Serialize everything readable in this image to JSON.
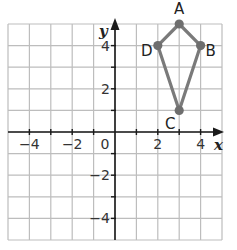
{
  "diagram": {
    "type": "coordinate-plane",
    "x_range": [
      -5,
      5
    ],
    "y_range": [
      -5,
      5
    ],
    "grid_step": 1,
    "x_axis_label": "x",
    "y_axis_label": "y",
    "x_tick_labels": [
      {
        "value": -4,
        "text": "−4"
      },
      {
        "value": -2,
        "text": "−2"
      },
      {
        "value": 2,
        "text": "2"
      },
      {
        "value": 4,
        "text": "4"
      }
    ],
    "y_tick_labels": [
      {
        "value": 4,
        "text": "4"
      },
      {
        "value": 2,
        "text": "2"
      },
      {
        "value": -2,
        "text": "−2"
      },
      {
        "value": -4,
        "text": "−4"
      }
    ],
    "origin_label": "0",
    "shape": {
      "name": "kite ABCD",
      "color": "#7a7a7a",
      "vertices": [
        {
          "label": "A",
          "x": 3,
          "y": 5
        },
        {
          "label": "B",
          "x": 4,
          "y": 4
        },
        {
          "label": "C",
          "x": 3,
          "y": 1
        },
        {
          "label": "D",
          "x": 2,
          "y": 4
        }
      ]
    },
    "colors": {
      "grid": "#bdbdbd",
      "axis": "#1a1a1a",
      "background": "#ffffff"
    }
  }
}
